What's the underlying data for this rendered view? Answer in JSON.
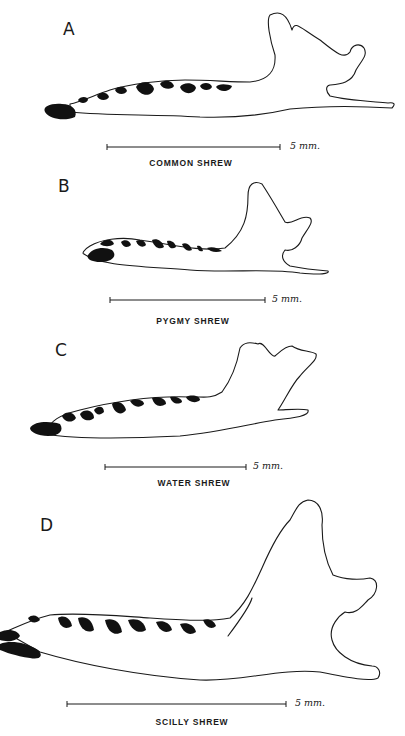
{
  "figure": {
    "panels": [
      {
        "id": "A",
        "label": "A",
        "caption": "COMMON SHREW",
        "scale_label": "5 mm."
      },
      {
        "id": "B",
        "label": "B",
        "caption": "PYGMY SHREW",
        "scale_label": "5 mm."
      },
      {
        "id": "C",
        "label": "C",
        "caption": "WATER SHREW",
        "scale_label": "5 mm."
      },
      {
        "id": "D",
        "label": "D",
        "caption": "SCILLY SHREW",
        "scale_label": "5 mm."
      }
    ]
  }
}
